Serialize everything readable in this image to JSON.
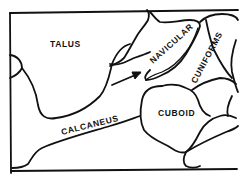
{
  "diagram": {
    "type": "anatomical line drawing",
    "labels": {
      "talus": "TALUS",
      "navicular": "NAVICULAR",
      "cuniforms": "CUNIFORMS",
      "cuboid": "CUBOID",
      "calcaneus": "CALCANEUS"
    },
    "annotations": {
      "arrow": "arrow pointing to talonavicular joint"
    },
    "colors": {
      "line": "#111111",
      "background": "#ffffff"
    }
  }
}
